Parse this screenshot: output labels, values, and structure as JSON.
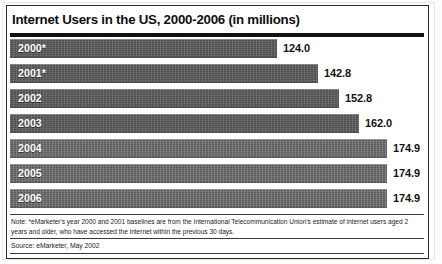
{
  "figure": {
    "title": "Internet Users in the US, 2000-2006 (in millions)",
    "note": "Note: *eMarketer's year 2000 and 2001 baselines are from the International Telecommunication Union's estimate of internet users aged 2 years and older, who have accessed the internet within the previous 30 days.",
    "source": "Source: eMarketer, May 2002",
    "colors": {
      "bar": "#585858",
      "bar_light": "#646464",
      "frame": "#2b2b2b",
      "title_rule": "#111111",
      "background": "#ffffff",
      "category_label": "#ffffff",
      "value_label": "#131313"
    }
  },
  "chart_data": {
    "type": "bar",
    "orientation": "horizontal",
    "title": "Internet Users in the US, 2000-2006 (in millions)",
    "xlabel": "",
    "ylabel": "",
    "unit": "millions",
    "categories": [
      "2000*",
      "2001*",
      "2002",
      "2003",
      "2004",
      "2005",
      "2006"
    ],
    "values": [
      124.0,
      142.8,
      152.8,
      162.0,
      174.9,
      174.9,
      174.9
    ],
    "value_labels": [
      "124.0",
      "142.8",
      "152.8",
      "162.0",
      "174.9",
      "174.9",
      "174.9"
    ],
    "xlim": [
      0,
      174.9
    ],
    "grid": false,
    "legend": false,
    "axis_visible": false,
    "bars": [
      {
        "category": "2000*",
        "value": 124.0,
        "label": "124.0",
        "pct": 70.9
      },
      {
        "category": "2001*",
        "value": 142.8,
        "label": "142.8",
        "pct": 81.6
      },
      {
        "category": "2002",
        "value": 152.8,
        "label": "152.8",
        "pct": 87.4
      },
      {
        "category": "2003",
        "value": 162.0,
        "label": "162.0",
        "pct": 92.6
      },
      {
        "category": "2004",
        "value": 174.9,
        "label": "174.9",
        "pct": 100.0
      },
      {
        "category": "2005",
        "value": 174.9,
        "label": "174.9",
        "pct": 100.0
      },
      {
        "category": "2006",
        "value": 174.9,
        "label": "174.9",
        "pct": 100.0
      }
    ]
  }
}
